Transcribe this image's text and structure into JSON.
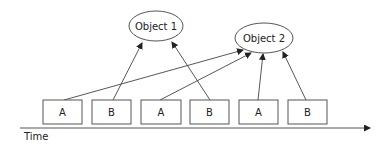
{
  "diagram": {
    "objects": [
      {
        "id": "obj1",
        "label": "Object 1",
        "cx": 156,
        "cy": 26,
        "rx": 27,
        "ry": 15
      },
      {
        "id": "obj2",
        "label": "Object 2",
        "cx": 264,
        "cy": 38,
        "rx": 29,
        "ry": 15
      }
    ],
    "boxes": [
      {
        "label": "A",
        "x": 43,
        "y": 100,
        "w": 39,
        "h": 24
      },
      {
        "label": "B",
        "x": 92,
        "y": 100,
        "w": 39,
        "h": 24
      },
      {
        "label": "A",
        "x": 141,
        "y": 100,
        "w": 40,
        "h": 24
      },
      {
        "label": "B",
        "x": 190,
        "y": 100,
        "w": 39,
        "h": 24
      },
      {
        "label": "A",
        "x": 239,
        "y": 100,
        "w": 39,
        "h": 24
      },
      {
        "label": "B",
        "x": 288,
        "y": 100,
        "w": 39,
        "h": 24
      }
    ],
    "arrows": [
      {
        "from": 0,
        "to": "obj2",
        "x1": 64,
        "y1": 100,
        "x2": 243,
        "y2": 50
      },
      {
        "from": 1,
        "to": "obj1",
        "x1": 113,
        "y1": 100,
        "x2": 142,
        "y2": 43
      },
      {
        "from": 2,
        "to": "obj2",
        "x1": 160,
        "y1": 100,
        "x2": 251,
        "y2": 53
      },
      {
        "from": 3,
        "to": "obj1",
        "x1": 210,
        "y1": 100,
        "x2": 172,
        "y2": 42
      },
      {
        "from": 4,
        "to": "obj2",
        "x1": 258,
        "y1": 100,
        "x2": 263,
        "y2": 54
      },
      {
        "from": 5,
        "to": "obj2",
        "x1": 306,
        "y1": 100,
        "x2": 283,
        "y2": 52
      }
    ],
    "time_axis": {
      "label": "Time",
      "x1": 20,
      "y": 128,
      "x2": 370
    }
  }
}
